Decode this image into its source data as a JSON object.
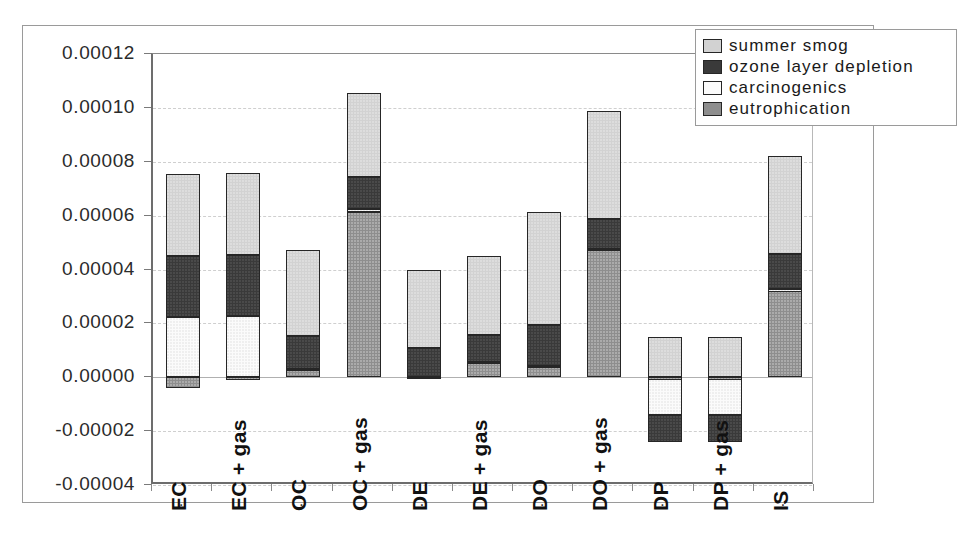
{
  "chart_data": {
    "type": "bar",
    "subtype": "stacked-bar-with-negatives",
    "title": "",
    "xlabel": "",
    "ylabel": "",
    "ylim": [
      -4e-05,
      0.00012
    ],
    "ytick_step": 2e-05,
    "ytick_labels": [
      "0.00012",
      "0.00010",
      "0.00008",
      "0.00006",
      "0.00004",
      "0.00002",
      "0.00000",
      "-0.00002",
      "-0.00004"
    ],
    "ytick_values": [
      0.00012,
      0.0001,
      8e-05,
      6e-05,
      4e-05,
      2e-05,
      0.0,
      -2e-05,
      -4e-05
    ],
    "grid": true,
    "legend_position": "top-right",
    "categories": [
      "EC",
      "EC + gas",
      "OC",
      "OC + gas",
      "DE",
      "DE + gas",
      "DO",
      "DO + gas",
      "DP",
      "DP + gas",
      "IS"
    ],
    "series": [
      {
        "name": "summer smog",
        "color": "#d2d2d2",
        "values": [
          3.05e-05,
          3.05e-05,
          3.18e-05,
          3.1e-05,
          2.93e-05,
          2.95e-05,
          4.2e-05,
          4e-05,
          1.5e-05,
          1.5e-05,
          3.65e-05
        ]
      },
      {
        "name": "ozone layer depletion",
        "color": "#3a3a3a",
        "values": [
          2.27e-05,
          2.27e-05,
          1.22e-05,
          1.2e-05,
          1.05e-05,
          9.8e-06,
          1.52e-05,
          1.1e-05,
          -1e-05,
          -1e-05,
          1.3e-05
        ]
      },
      {
        "name": "carcinogenics",
        "color": "#fbfbfb",
        "values": [
          2.22e-05,
          2.27e-05,
          2e-07,
          1e-06,
          2e-07,
          3e-07,
          2e-07,
          2e-07,
          -1.35e-05,
          -1.35e-05,
          2e-07
        ]
      },
      {
        "name": "eutrophication",
        "color": "#8e8e8e",
        "values": [
          -4e-06,
          -2e-07,
          3e-06,
          6.15e-05,
          0.0,
          5.5e-06,
          4e-06,
          4.75e-05,
          -5e-07,
          -5e-07,
          3.25e-05
        ]
      }
    ],
    "totals_positive": [
      7.54e-05,
      7.59e-05,
      4.7e-05,
      0.0001055,
      3.98e-05,
      4.51e-05,
      6.14e-05,
      9.85e-05,
      1.5e-05,
      1.5e-05,
      8.22e-05
    ],
    "totals_negative": [
      -4e-06,
      -2e-07,
      0.0,
      0.0,
      -2e-07,
      0.0,
      -5e-07,
      -5e-07,
      -2.4e-05,
      -2.4e-05,
      -1.8e-06
    ]
  },
  "legend": {
    "items": [
      {
        "label": "summer smog",
        "swatch": "smog"
      },
      {
        "label": "ozone layer depletion",
        "swatch": "ozone"
      },
      {
        "label": "carcinogenics",
        "swatch": "carc"
      },
      {
        "label": "eutrophication",
        "swatch": "eutro"
      }
    ]
  }
}
